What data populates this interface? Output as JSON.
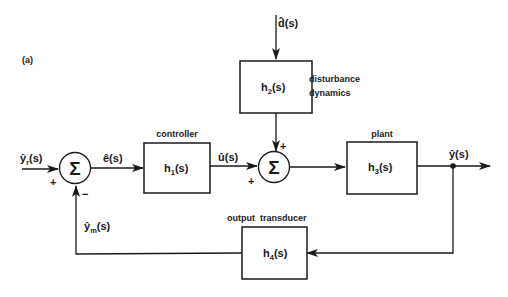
{
  "figure": {
    "panel_label": "(a)"
  },
  "blocks": {
    "controller": {
      "caption": "controller",
      "tf": "h",
      "sub": "1",
      "tf_tail": "(s)"
    },
    "disturbance": {
      "caption_line1": "disturbance",
      "caption_line2": "dynamics",
      "tf": "h",
      "sub": "2",
      "tf_tail": "(s)"
    },
    "plant": {
      "caption": "plant",
      "tf": "h",
      "sub": "3",
      "tf_tail": "(s)"
    },
    "transducer": {
      "caption": "output  transducer",
      "tf": "h",
      "sub": "4",
      "tf_tail": "(s)"
    }
  },
  "signals": {
    "reference": {
      "base": "ŷ",
      "sub": "r",
      "tail": "(s)"
    },
    "error": {
      "text": "ê(s)"
    },
    "control": {
      "text": "û(s)"
    },
    "disturbance": {
      "text": "d̂(s)"
    },
    "output": {
      "text": "ŷ(s)"
    },
    "measured": {
      "base": "ŷ",
      "sub": "m",
      "tail": "(s)"
    }
  },
  "summing_junctions": {
    "sum1": {
      "symbol": "Σ",
      "sign_in": "+",
      "sign_fb": "−"
    },
    "sum2": {
      "symbol": "Σ",
      "sign_in": "+",
      "sign_dist": "+"
    }
  }
}
